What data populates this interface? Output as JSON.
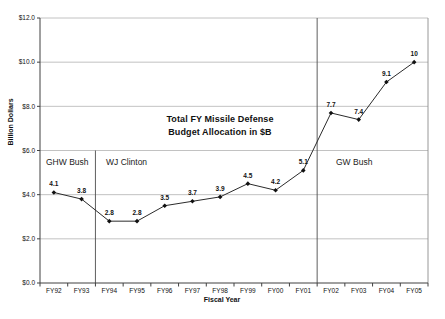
{
  "page": {
    "background": "#ffffff"
  },
  "chart_data": {
    "type": "line",
    "title": "Total FY Missile Defense Budget Allocation in $B",
    "title_lines": [
      "Total FY Missile Defense",
      "Budget Allocation in $B"
    ],
    "xlabel": "Fiscal Year",
    "ylabel": "Billion Dollars",
    "categories": [
      "FY92",
      "FY93",
      "FY94",
      "FY95",
      "FY96",
      "FY97",
      "FY98",
      "FY99",
      "FY00",
      "FY01",
      "FY02",
      "FY03",
      "FY04",
      "FY05"
    ],
    "values": [
      4.1,
      3.8,
      2.8,
      2.8,
      3.5,
      3.7,
      3.9,
      4.5,
      4.2,
      5.1,
      7.7,
      7.4,
      9.1,
      10
    ],
    "value_labels": [
      "4.1",
      "3.8",
      "2.8",
      "2.8",
      "3.5",
      "3.7",
      "3.9",
      "4.5",
      "4.2",
      "5.1",
      "7.7",
      "7.4",
      "9.1",
      "10"
    ],
    "ylim": [
      0,
      12
    ],
    "ytick_interval": 2,
    "ytick_labels": [
      "$0.0",
      "$2.0",
      "$4.0",
      "$6.0",
      "$8.0",
      "$10.0",
      "$12.0"
    ],
    "grid": true,
    "legend_position": "none",
    "marker": "diamond",
    "annotations": [
      {
        "label": "GHW Bush"
      },
      {
        "label": "WJ Clinton"
      },
      {
        "label": "GW Bush"
      }
    ],
    "dividers": [
      {
        "after_category": "FY93",
        "from_value": 6
      },
      {
        "after_category": "FY01",
        "from_value": 12
      }
    ],
    "colors": {
      "line": "#2b2b2b",
      "marker": "#111111",
      "grid": "#b3b3b3",
      "axis": "#404040",
      "border": "#8c8c8c",
      "divider": "#4d4d4d",
      "text": "#111111"
    }
  }
}
